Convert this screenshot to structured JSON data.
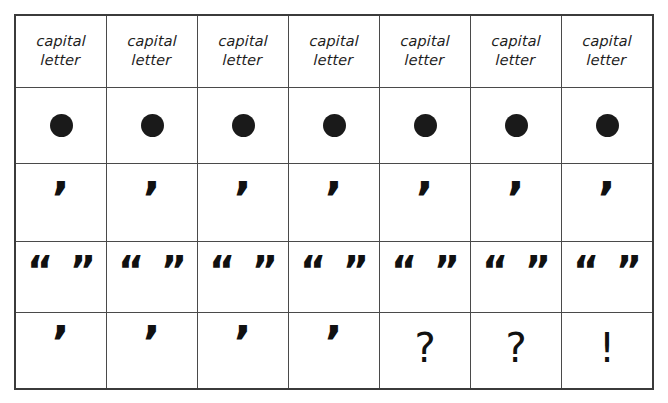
{
  "worksheet": {
    "title": "capital letter punctuation practice grid",
    "columns": 7,
    "rows": 5,
    "ink_color": "#1a1a1a",
    "line_color": "#4a4a4a",
    "border_color": "#3b3b3b",
    "background_color": "#ffffff"
  },
  "grid": {
    "rows": [
      {
        "name": "header-row",
        "kind": "label",
        "cells": [
          {
            "text": "capital\nletter"
          },
          {
            "text": "capital\nletter"
          },
          {
            "text": "capital\nletter"
          },
          {
            "text": "capital\nletter"
          },
          {
            "text": "capital\nletter"
          },
          {
            "text": "capital\nletter"
          },
          {
            "text": "capital\nletter"
          }
        ]
      },
      {
        "name": "full-stop-row",
        "kind": "dot",
        "cells": [
          {
            "text": ""
          },
          {
            "text": ""
          },
          {
            "text": ""
          },
          {
            "text": ""
          },
          {
            "text": ""
          },
          {
            "text": ""
          },
          {
            "text": ""
          }
        ]
      },
      {
        "name": "apostrophe-row",
        "kind": "apostrophe",
        "cells": [
          {
            "text": "’"
          },
          {
            "text": "’"
          },
          {
            "text": "’"
          },
          {
            "text": "’"
          },
          {
            "text": "’"
          },
          {
            "text": "’"
          },
          {
            "text": "’"
          }
        ]
      },
      {
        "name": "quotation-marks-row",
        "kind": "quote-pair",
        "cells": [
          {
            "open": "“",
            "close": "”"
          },
          {
            "open": "“",
            "close": "”"
          },
          {
            "open": "“",
            "close": "”"
          },
          {
            "open": "“",
            "close": "”"
          },
          {
            "open": "“",
            "close": "”"
          },
          {
            "open": "“",
            "close": "”"
          },
          {
            "open": "“",
            "close": "”"
          }
        ]
      },
      {
        "name": "terminal-punctuation-row",
        "kind": "mixed",
        "cells": [
          {
            "text": "’",
            "glyph": "apostrophe"
          },
          {
            "text": "’",
            "glyph": "apostrophe"
          },
          {
            "text": "’",
            "glyph": "apostrophe"
          },
          {
            "text": "’",
            "glyph": "apostrophe"
          },
          {
            "text": "?",
            "glyph": "question-mark"
          },
          {
            "text": "?",
            "glyph": "question-mark"
          },
          {
            "text": "!",
            "glyph": "exclamation-mark"
          }
        ]
      }
    ]
  }
}
